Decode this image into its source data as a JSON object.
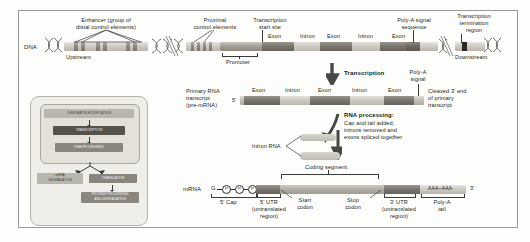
{
  "figure": {
    "colors": {
      "exon": "#7a766f",
      "intron": "#cdcac2",
      "control_element": "#8e8a82",
      "terminator": "#2b2926",
      "panel_bg": "#efeee9",
      "frame": "#9a9a9a"
    }
  },
  "dna_row": {
    "row_label": "DNA",
    "labels": {
      "enhancer": "Enhancer (group of\ndistal control elements)",
      "enhancer_line1": "Enhancer (group of",
      "enhancer_line2": "distal control elements)",
      "proximal": "Proximal\ncontrol elements",
      "proximal_line1": "Proximal",
      "proximal_line2": "control elements",
      "start_site": "Transcription\nstart site",
      "start_site_line1": "Transcription",
      "start_site_line2": "start site",
      "polya_signal_seq": "Poly-A signal\nsequence",
      "polya_signal_seq_line1": "Poly-A signal",
      "polya_signal_seq_line2": "sequence",
      "termination": "Transcription\ntermination\nregion",
      "termination_line1": "Transcription",
      "termination_line2": "termination",
      "termination_line3": "region",
      "upstream": "Upstream",
      "downstream": "Downstream",
      "promoter": "Promoter"
    },
    "segments": [
      "Exon",
      "Intron",
      "Exon",
      "Intron",
      "Exon"
    ]
  },
  "transcription": {
    "arrow_label": "Transcription"
  },
  "primary_transcript": {
    "row_label_line1": "Primary RNA",
    "row_label_line2": "transcript",
    "row_label_line3": "(pre-mRNA)",
    "five_prime": "5'",
    "segments": [
      "Exon",
      "Intron",
      "Exon",
      "Intron",
      "Exon"
    ],
    "polya_signal_line1": "Poly-A",
    "polya_signal_line2": "signal",
    "cleaved_line1": "Cleaved 3' end",
    "cleaved_line2": "of primary",
    "cleaved_line3": "transcript"
  },
  "rna_processing": {
    "heading": "RNA processing:",
    "line1": "Cap and tail added;",
    "line2": "introns removed and",
    "line3": "exons spliced together",
    "intron_rna_label": "Intron RNA"
  },
  "mrna_row": {
    "row_label": "mRNA",
    "cap_g": "G",
    "cap_p": "P",
    "five_cap": "5' Cap",
    "five_utr_line1": "5' UTR",
    "five_utr_line2": "(untranslated",
    "five_utr_line3": "region)",
    "start_codon_line1": "Start",
    "start_codon_line2": "codon",
    "coding_segment": "Coding segment",
    "stop_codon_line1": "Stop",
    "stop_codon_line2": "codon",
    "three_utr_line1": "3' UTR",
    "three_utr_line2": "(untranslated",
    "three_utr_line3": "region)",
    "polya_tail_line1": "Poly-A",
    "polya_tail_line2": "tail",
    "polya_seq": "AAA~AAA",
    "three_prime": "3'"
  },
  "flowchart": {
    "steps": [
      {
        "label": "CHROMATIN MODIFICATION",
        "style": "lt"
      },
      {
        "label": "TRANSCRIPTION",
        "style": "dk"
      },
      {
        "label": "RNA PROCESSING",
        "style": "md"
      },
      {
        "label": "mRNA DEGRADATION",
        "style": "lt"
      },
      {
        "label": "TRANSLATION",
        "style": "md"
      },
      {
        "label": "PROTEIN PROCESSING AND DEGRADATION",
        "style": "md"
      }
    ],
    "mrna_degradation_line1": "mRNA",
    "mrna_degradation_line2": "DEGRADATION",
    "translation": "TRANSLATION",
    "protein_line1": "PROTEIN PROCESSING",
    "protein_line2": "AND DEGRADATION"
  }
}
